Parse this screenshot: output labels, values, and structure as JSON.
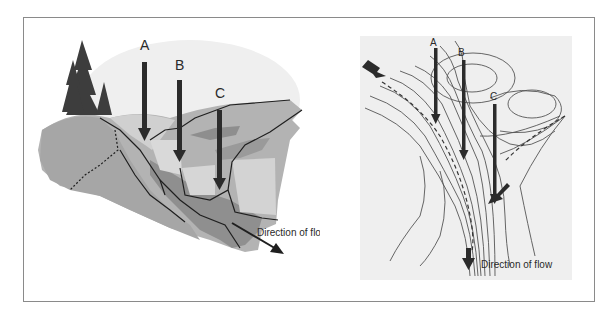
{
  "figure": {
    "left_panel": {
      "title": "Block diagram of a valley with tributaries",
      "labels": {
        "a": "A",
        "b": "B",
        "c": "C"
      },
      "flow_label": "Direction of flow"
    },
    "right_panel": {
      "title": "Topographic contour map of the same valley",
      "labels": {
        "a": "A",
        "b": "B",
        "c": "C"
      },
      "flow_label": "Direction of flow"
    },
    "colors": {
      "frame": "#8a8a8a",
      "sky": "#eeeeee",
      "land_light": "#c9c9c9",
      "land_mid": "#a9a9a9",
      "land_dark": "#8c8c8c",
      "tree": "#3a3a3a",
      "arrow": "#2b2b2b",
      "map_bg": "#efefef",
      "contour": "#555555"
    }
  }
}
